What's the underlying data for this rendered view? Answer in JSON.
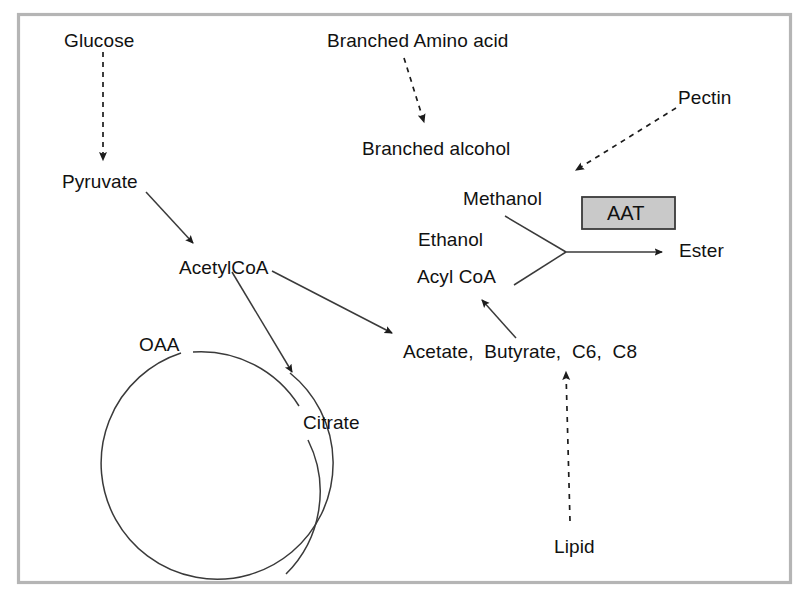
{
  "figure": {
    "kind": "metabolic-pathway-diagram",
    "frame": {
      "border_color": "#b5b5b5",
      "background_color": "#ffffff"
    },
    "stroke_color": "#2b2b2b"
  },
  "nodes": [
    {
      "id": "glucose",
      "label": "Glucose",
      "x": 64,
      "y": 31
    },
    {
      "id": "branched-amino-acid",
      "label": "Branched Amino acid",
      "x": 327,
      "y": 31
    },
    {
      "id": "pectin",
      "label": "Pectin",
      "x": 678,
      "y": 88
    },
    {
      "id": "branched-alcohol",
      "label": "Branched alcohol",
      "x": 362,
      "y": 139
    },
    {
      "id": "pyruvate",
      "label": "Pyruvate",
      "x": 62,
      "y": 172
    },
    {
      "id": "methanol",
      "label": "Methanol",
      "x": 463,
      "y": 189
    },
    {
      "id": "ethanol",
      "label": "Ethanol",
      "x": 418,
      "y": 230
    },
    {
      "id": "ester",
      "label": "Ester",
      "x": 679,
      "y": 241
    },
    {
      "id": "acetylcoa",
      "label": "AcetylCoA",
      "x": 179,
      "y": 258
    },
    {
      "id": "acyl-coa",
      "label": "Acyl CoA",
      "x": 417,
      "y": 267
    },
    {
      "id": "oaa",
      "label": "OAA",
      "x": 139,
      "y": 335
    },
    {
      "id": "acetate-group",
      "label": "Acetate,  Butyrate,  C6,  C8",
      "x": 403,
      "y": 342
    },
    {
      "id": "citrate",
      "label": "Citrate",
      "x": 303,
      "y": 413
    },
    {
      "id": "lipid",
      "label": "Lipid",
      "x": 554,
      "y": 537
    }
  ],
  "enzyme_box": {
    "id": "aat",
    "label": "AAT",
    "fill_color": "#c9c9c9",
    "border_color": "#3a3a3a"
  },
  "edges": [
    {
      "id": "glucose-to-pyruvate",
      "from": "glucose",
      "to": "pyruvate",
      "style": "dashed"
    },
    {
      "id": "amino-acid-to-alcohol",
      "from": "branched-amino-acid",
      "to": "branched-alcohol",
      "style": "dashed"
    },
    {
      "id": "pectin-to-methanol",
      "from": "pectin",
      "to": "methanol",
      "style": "dashed"
    },
    {
      "id": "pyruvate-to-acetylcoa",
      "from": "pyruvate",
      "to": "acetylcoa",
      "style": "solid"
    },
    {
      "id": "acetylcoa-to-citrate",
      "from": "acetylcoa",
      "to": "citrate",
      "style": "solid"
    },
    {
      "id": "acetylcoa-to-acetate",
      "from": "acetylcoa",
      "to": "acetate-group",
      "style": "solid"
    },
    {
      "id": "acetate-to-acylcoa",
      "from": "acetate-group",
      "to": "acyl-coa",
      "style": "solid"
    },
    {
      "id": "lipid-to-acetate",
      "from": "lipid",
      "to": "acetate-group",
      "style": "dashed"
    },
    {
      "id": "alcohols-to-ester",
      "from": "methanol-ethanol-acylcoa",
      "to": "ester",
      "style": "solid"
    }
  ],
  "cycle": {
    "id": "tca-cycle",
    "members": [
      "oaa",
      "citrate"
    ]
  }
}
